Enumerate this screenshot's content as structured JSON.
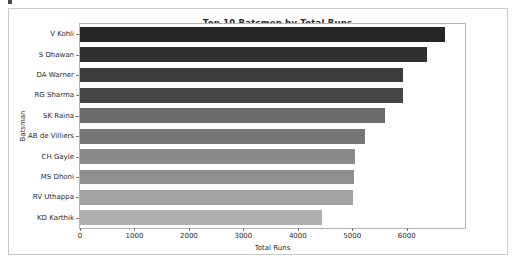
{
  "figure": {
    "title": "Top 10 Batsmen by Total Runs",
    "xlabel": "Total Runs",
    "ylabel": "Batsman",
    "frame_color": "#c9c9c9",
    "axes_color": "#b4b4b4",
    "text_color": "#2b2b2b"
  },
  "chart_data": {
    "type": "bar",
    "orientation": "horizontal",
    "title": "Top 10 Batsmen by Total Runs",
    "xlabel": "Total Runs",
    "ylabel": "Batsman",
    "categories": [
      "V Kohli",
      "S Dhawan",
      "DA Warner",
      "RG Sharma",
      "SK Raina",
      "AB de Villiers",
      "CH Gayle",
      "MS Dhoni",
      "RV Uthappa",
      "KD Karthik"
    ],
    "values": [
      6700,
      6370,
      5930,
      5940,
      5600,
      5230,
      5050,
      5040,
      5010,
      4440
    ],
    "bar_colors": [
      "#262626",
      "#303030",
      "#3d3d3d",
      "#454545",
      "#6b6b6b",
      "#757575",
      "#8a8a8a",
      "#909090",
      "#a3a3a3",
      "#b0b0b0"
    ],
    "xlim": [
      0,
      7070
    ],
    "ylim_categories": 10,
    "xticks": [
      0,
      1000,
      2000,
      3000,
      4000,
      5000,
      6000
    ],
    "xticklabels": [
      "0",
      "1000",
      "2000",
      "3000",
      "4000",
      "5000",
      "6000"
    ],
    "grid": false,
    "legend": null,
    "palette": "greys-sequential-dark-to-light"
  }
}
